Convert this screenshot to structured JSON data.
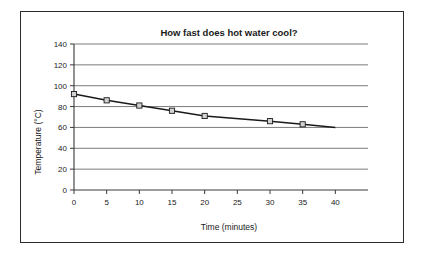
{
  "figure": {
    "background_color": "#ffffff",
    "border_color": "#2b2b2b"
  },
  "chart_data": {
    "type": "line",
    "title": "How fast does hot water cool?",
    "xlabel": "Time (minutes)",
    "ylabel": "Temperature (°C)",
    "xlim": [
      0,
      45
    ],
    "ylim": [
      0,
      140
    ],
    "xticks": [
      0,
      5,
      10,
      15,
      20,
      25,
      30,
      35,
      40
    ],
    "yticks": [
      0,
      20,
      40,
      60,
      80,
      100,
      120,
      140
    ],
    "xtick_labels": [
      "0",
      "5",
      "10",
      "15",
      "20",
      "25",
      "30",
      "35",
      "40"
    ],
    "ytick_labels": [
      "0",
      "20",
      "40",
      "60",
      "80",
      "100",
      "120",
      "140"
    ],
    "grid": "horizontal",
    "legend": "none",
    "line_color": "#1a1a1a",
    "marker_fill": "#d2d2d2",
    "marker_edge": "#1a1a1a",
    "marker_shape": "square",
    "x": [
      0,
      5,
      10,
      15,
      20,
      30,
      35,
      40
    ],
    "values": [
      92,
      86,
      81,
      76,
      71,
      66,
      63,
      60
    ],
    "marker_x": [
      0,
      5,
      10,
      15,
      20,
      30,
      35
    ],
    "marker_values": [
      92,
      86,
      81,
      76,
      71,
      66,
      63
    ],
    "series": [
      {
        "name": "Water temperature",
        "x": [
          0,
          5,
          10,
          15,
          20,
          30,
          35,
          40
        ],
        "values": [
          92,
          86,
          81,
          76,
          71,
          66,
          63,
          60
        ]
      }
    ]
  }
}
